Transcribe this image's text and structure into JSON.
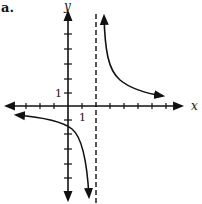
{
  "figure": {
    "panel_label": "a.",
    "x_axis_label": "x",
    "y_axis_label": "y",
    "x_tick_label": "1",
    "y_tick_label": "1",
    "function": "y = 3/(x - 2)",
    "vertical_asymptote": "x = 2",
    "horizontal_asymptote": "y = 0",
    "colors": {
      "curve": "#111111",
      "axes": "#111111",
      "asymptote": "#111111"
    }
  }
}
